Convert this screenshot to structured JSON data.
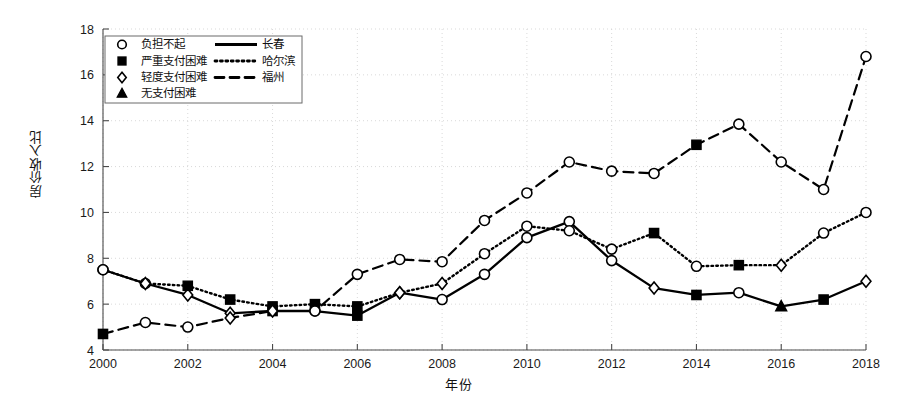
{
  "chart_data": {
    "type": "line",
    "title": "",
    "xlabel": "年份",
    "ylabel": "房价收入比",
    "xlim": [
      2000,
      2018
    ],
    "ylim": [
      4,
      18
    ],
    "yticks": [
      4,
      6,
      8,
      10,
      12,
      14,
      16,
      18
    ],
    "xticks": [
      2000,
      2002,
      2004,
      2006,
      2008,
      2010,
      2012,
      2014,
      2016,
      2018
    ],
    "grid": true,
    "legend_position": "upper-left",
    "x": [
      2000,
      2001,
      2002,
      2003,
      2004,
      2005,
      2006,
      2007,
      2008,
      2009,
      2010,
      2011,
      2012,
      2013,
      2014,
      2015,
      2016,
      2017,
      2018
    ],
    "series": [
      {
        "name": "长春",
        "line_style": "solid",
        "values": [
          7.5,
          6.9,
          6.4,
          5.6,
          5.7,
          5.7,
          5.5,
          6.5,
          6.2,
          7.3,
          8.9,
          9.6,
          7.9,
          6.7,
          6.4,
          6.5,
          5.9,
          6.2,
          7.0
        ],
        "markers": [
          "circle",
          "circle",
          "diamond",
          "diamond",
          "square",
          "circle",
          "square",
          "diamond",
          "circle",
          "circle",
          "circle",
          "circle",
          "circle",
          "diamond",
          "square",
          "circle",
          "triangle",
          "square",
          "diamond"
        ]
      },
      {
        "name": "哈尔滨",
        "line_style": "dotted",
        "values": [
          7.5,
          6.9,
          6.8,
          6.2,
          5.9,
          6.0,
          5.9,
          6.5,
          6.9,
          8.2,
          9.4,
          9.2,
          8.4,
          9.1,
          7.65,
          7.7,
          7.7,
          9.1,
          10.0
        ],
        "markers": [
          "circle",
          "diamond",
          "square",
          "square",
          "square",
          "square",
          "square",
          "diamond",
          "diamond",
          "circle",
          "circle",
          "circle",
          "circle",
          "square",
          "circle",
          "square",
          "diamond",
          "circle",
          "circle"
        ]
      },
      {
        "name": "福州",
        "line_style": "dashed",
        "values": [
          4.7,
          5.2,
          5.0,
          5.4,
          5.7,
          5.7,
          7.3,
          7.95,
          7.85,
          9.65,
          10.85,
          12.2,
          11.8,
          11.7,
          12.95,
          13.85,
          12.2,
          11.0,
          16.8
        ],
        "markers": [
          "square",
          "circle",
          "circle",
          "diamond",
          "diamond",
          "circle",
          "circle",
          "circle",
          "circle",
          "circle",
          "circle",
          "circle",
          "circle",
          "circle",
          "square",
          "circle",
          "circle",
          "circle",
          "circle"
        ]
      }
    ],
    "legend_markers": [
      {
        "symbol": "circle",
        "label": "负担不起"
      },
      {
        "symbol": "square",
        "label": "严重支付困难"
      },
      {
        "symbol": "diamond",
        "label": "轻度支付困难"
      },
      {
        "symbol": "triangle",
        "label": "无支付困难"
      }
    ],
    "legend_lines": [
      {
        "style": "solid",
        "label": "长春"
      },
      {
        "style": "dotted",
        "label": "哈尔滨"
      },
      {
        "style": "dashed",
        "label": "福州"
      }
    ],
    "colors": {
      "line": "#000000",
      "grid": "#cfcfcf",
      "axis": "#555555",
      "background": "#ffffff"
    }
  }
}
